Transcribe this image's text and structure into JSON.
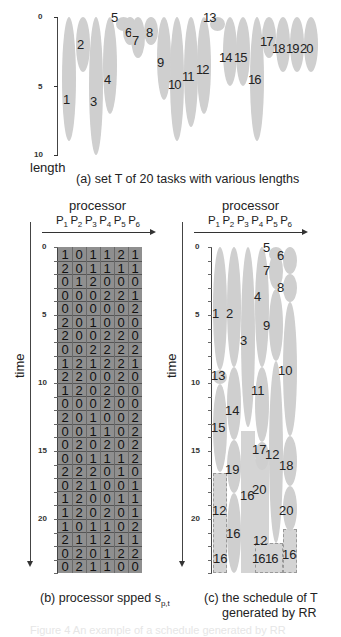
{
  "panel_a": {
    "caption": "(a) set T of 20 tasks with various lengths",
    "y_label": "length",
    "y_ticks": [
      "0",
      "5",
      "10"
    ],
    "tasks": [
      {
        "id": "1",
        "length": 9
      },
      {
        "id": "2",
        "length": 4
      },
      {
        "id": "3",
        "length": 10
      },
      {
        "id": "4",
        "length": 7
      },
      {
        "id": "5",
        "length": 1
      },
      {
        "id": "6",
        "length": 2
      },
      {
        "id": "7",
        "length": 3
      },
      {
        "id": "8",
        "length": 2
      },
      {
        "id": "9",
        "length": 6
      },
      {
        "id": "10",
        "length": 9
      },
      {
        "id": "11",
        "length": 8
      },
      {
        "id": "12",
        "length": 7
      },
      {
        "id": "13",
        "length": 1
      },
      {
        "id": "14",
        "length": 5
      },
      {
        "id": "15",
        "length": 5
      },
      {
        "id": "16",
        "length": 9
      },
      {
        "id": "17",
        "length": 3
      },
      {
        "id": "18",
        "length": 4
      },
      {
        "id": "19",
        "length": 4
      },
      {
        "id": "20",
        "length": 4
      }
    ]
  },
  "panel_b": {
    "title": "processor",
    "processors": [
      "P",
      "P",
      "P",
      "P",
      "P",
      "P"
    ],
    "processor_subs": [
      "1",
      "2",
      "3",
      "4",
      "5",
      "6"
    ],
    "y_label": "time",
    "y_ticks": [
      "0",
      "5",
      "10",
      "15",
      "20"
    ],
    "caption_prefix": "(b) processor spped s",
    "caption_sub": "p,t",
    "speeds": [
      [
        1,
        0,
        1,
        1,
        2,
        1
      ],
      [
        2,
        0,
        1,
        1,
        1,
        1
      ],
      [
        0,
        1,
        2,
        0,
        0,
        0
      ],
      [
        0,
        0,
        0,
        2,
        2,
        1
      ],
      [
        0,
        0,
        0,
        0,
        0,
        2
      ],
      [
        2,
        0,
        1,
        0,
        0,
        0
      ],
      [
        2,
        0,
        0,
        2,
        2,
        0
      ],
      [
        0,
        0,
        2,
        2,
        2,
        2
      ],
      [
        1,
        2,
        1,
        2,
        2,
        1
      ],
      [
        2,
        2,
        0,
        0,
        2,
        0
      ],
      [
        1,
        2,
        0,
        2,
        0,
        0
      ],
      [
        0,
        0,
        0,
        2,
        0,
        0
      ],
      [
        2,
        0,
        1,
        0,
        0,
        2
      ],
      [
        0,
        0,
        1,
        1,
        0,
        2
      ],
      [
        0,
        2,
        0,
        2,
        0,
        2
      ],
      [
        0,
        0,
        1,
        1,
        1,
        2
      ],
      [
        2,
        2,
        2,
        0,
        1,
        0
      ],
      [
        0,
        2,
        1,
        0,
        0,
        1
      ],
      [
        1,
        2,
        0,
        0,
        1,
        1
      ],
      [
        1,
        2,
        0,
        2,
        0,
        1
      ],
      [
        1,
        0,
        1,
        1,
        0,
        2
      ],
      [
        2,
        1,
        1,
        2,
        1,
        1
      ],
      [
        0,
        2,
        0,
        1,
        2,
        2
      ],
      [
        0,
        2,
        1,
        1,
        0,
        0
      ]
    ]
  },
  "panel_c": {
    "title": "processor",
    "processors": [
      "P",
      "P",
      "P",
      "P",
      "P",
      "P"
    ],
    "processor_subs": [
      "1",
      "2",
      "3",
      "4",
      "5",
      "6"
    ],
    "y_label": "time",
    "y_ticks": [
      "0",
      "5",
      "10",
      "15",
      "20"
    ],
    "caption_line1": "(c) the schedule of T",
    "caption_line2": "generated by RR",
    "labels": {
      "t1": "1",
      "t2": "2",
      "t3": "3",
      "t4": "4",
      "t5": "5",
      "t6": "6",
      "t7": "7",
      "t8": "8",
      "t9": "9",
      "t10": "10",
      "t11": "11",
      "t12a": "12",
      "t13": "13",
      "t14": "14",
      "t15": "15",
      "t17": "17",
      "t18": "18",
      "t19": "19",
      "t20a": "20",
      "t20b": "20",
      "t12b": "12",
      "t12c": "12",
      "t16a": "16",
      "t16b": "16",
      "t16c": "16",
      "t16d": "16",
      "t16e": "16",
      "t16f": "16"
    }
  },
  "figure_caption": "Figure 4  An example of a schedule generated by RR"
}
